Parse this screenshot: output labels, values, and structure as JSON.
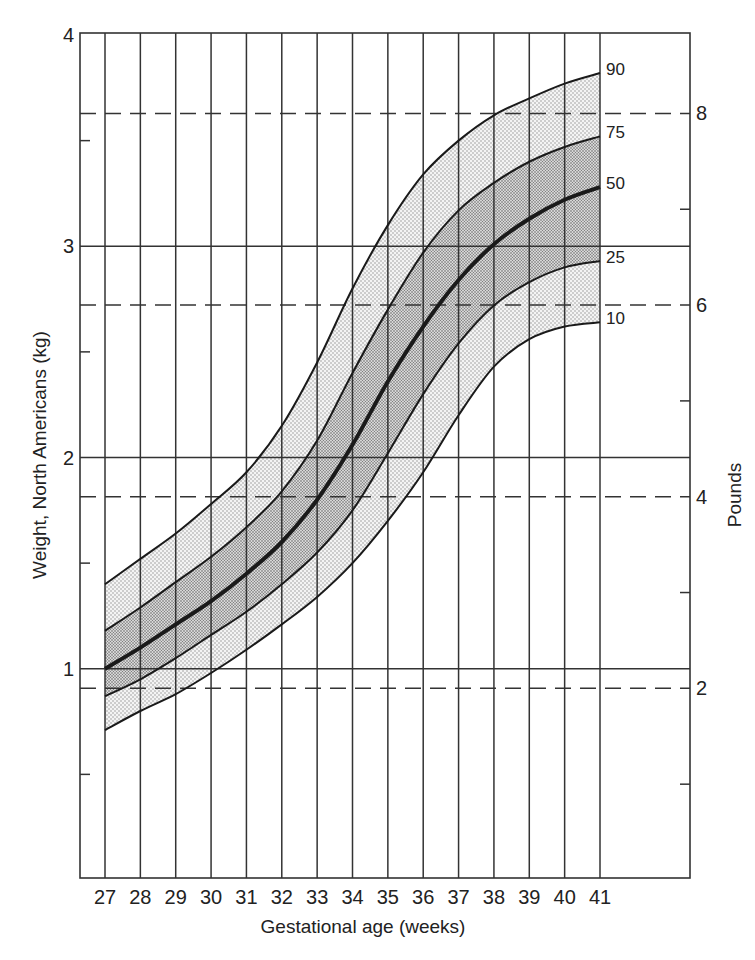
{
  "chart_data": {
    "type": "area",
    "title": "",
    "xlabel": "Gestational age (weeks)",
    "ylabel": "Weight, North Americans (kg)",
    "ylabel_right": "Pounds",
    "x": [
      27,
      28,
      29,
      30,
      31,
      32,
      33,
      34,
      35,
      36,
      37,
      38,
      39,
      40,
      41
    ],
    "xlim": [
      27,
      41
    ],
    "ylim": [
      0,
      4
    ],
    "y_ticks_kg": [
      1,
      2,
      3,
      4
    ],
    "y_minor_ticks_kg": [
      0.5,
      1.5,
      2.5,
      3.5
    ],
    "y_ticks_lb": [
      2,
      4,
      6,
      8
    ],
    "y_minor_ticks_lb": [
      1,
      3,
      5,
      7
    ],
    "grid": true,
    "series": [
      {
        "name": "90",
        "percentile": 90,
        "values": [
          1.4,
          1.52,
          1.64,
          1.78,
          1.93,
          2.15,
          2.45,
          2.8,
          3.1,
          3.34,
          3.5,
          3.62,
          3.7,
          3.77,
          3.82
        ]
      },
      {
        "name": "75",
        "percentile": 75,
        "values": [
          1.18,
          1.29,
          1.41,
          1.53,
          1.67,
          1.84,
          2.08,
          2.4,
          2.7,
          2.97,
          3.17,
          3.3,
          3.4,
          3.47,
          3.52
        ]
      },
      {
        "name": "50",
        "percentile": 50,
        "values": [
          1.0,
          1.1,
          1.21,
          1.32,
          1.45,
          1.6,
          1.8,
          2.06,
          2.36,
          2.62,
          2.84,
          3.01,
          3.13,
          3.22,
          3.28
        ]
      },
      {
        "name": "25",
        "percentile": 25,
        "values": [
          0.87,
          0.95,
          1.05,
          1.16,
          1.27,
          1.4,
          1.55,
          1.75,
          2.02,
          2.3,
          2.54,
          2.72,
          2.83,
          2.9,
          2.93
        ]
      },
      {
        "name": "10",
        "percentile": 10,
        "values": [
          0.71,
          0.8,
          0.88,
          0.98,
          1.09,
          1.21,
          1.34,
          1.5,
          1.7,
          1.93,
          2.2,
          2.43,
          2.56,
          2.62,
          2.64
        ]
      }
    ],
    "bands": [
      {
        "between": [
          "10",
          "25"
        ],
        "shade": "light"
      },
      {
        "between": [
          "25",
          "75"
        ],
        "shade": "dark"
      },
      {
        "between": [
          "75",
          "90"
        ],
        "shade": "light"
      }
    ],
    "legend_position": "right-end curve labels"
  },
  "colors": {
    "line": "#1a1a1a",
    "grid": "#333333",
    "band_light": "#dcdcdc",
    "band_dark": "#b9b9b9",
    "background": "#ffffff"
  }
}
